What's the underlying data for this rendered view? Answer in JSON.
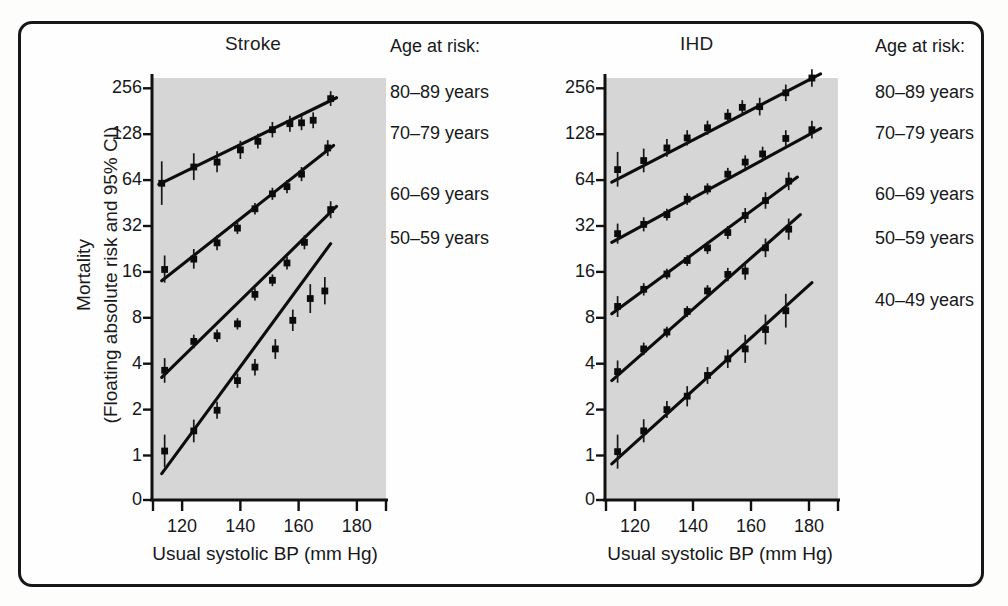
{
  "figure": {
    "background_color": "#fdfdfc",
    "frame_color": "#15181a",
    "plot_background_color": "#d6d6d6",
    "ink_color": "#0d0d0d"
  },
  "axis": {
    "y_title_line1": "Mortality",
    "y_title_line2": "(Floating absolute risk and 95% CI)",
    "y_ticks": [
      "256",
      "128",
      "64",
      "32",
      "16",
      "8",
      "4",
      "2",
      "1",
      "0"
    ],
    "x_title": "Usual systolic BP (mm Hg)",
    "x_ticks": [
      "120",
      "140",
      "160",
      "180"
    ]
  },
  "legend": {
    "heading": "Age at risk:",
    "stroke_items": [
      "80–89 years",
      "70–79 years",
      "60–69 years",
      "50–59 years"
    ],
    "ihd_items": [
      "80–89 years",
      "70–79 years",
      "60–69 years",
      "50–59 years",
      "40–49 years"
    ]
  },
  "panels": [
    {
      "id": "stroke",
      "title": "Stroke"
    },
    {
      "id": "ihd",
      "title": "IHD"
    }
  ],
  "chart_data": {
    "type": "scatter",
    "xlabel": "Usual systolic BP (mm Hg)",
    "ylabel": "Mortality (Floating absolute risk and 95% CI)",
    "xlim": [
      110,
      190
    ],
    "xticks": [
      120,
      140,
      160,
      180
    ],
    "yscale": "log2",
    "yticks": [
      1,
      2,
      4,
      8,
      16,
      32,
      64,
      128,
      256
    ],
    "ytick_labels": [
      "1",
      "2",
      "4",
      "8",
      "16",
      "32",
      "64",
      "128",
      "256"
    ],
    "y_axis_break_label": "0",
    "grid": false,
    "legend_position": "right-outside",
    "legend_title": "Age at risk:",
    "panels": [
      {
        "name": "Stroke",
        "series": [
          {
            "name": "80–89 years",
            "points": [
              {
                "x": 113,
                "y": 61,
                "ci_low": 44,
                "ci_high": 85
              },
              {
                "x": 124,
                "y": 78,
                "ci_low": 64,
                "ci_high": 96
              },
              {
                "x": 132,
                "y": 84,
                "ci_low": 72,
                "ci_high": 99
              },
              {
                "x": 140,
                "y": 101,
                "ci_low": 88,
                "ci_high": 116
              },
              {
                "x": 146,
                "y": 115,
                "ci_low": 103,
                "ci_high": 129
              },
              {
                "x": 151,
                "y": 137,
                "ci_low": 122,
                "ci_high": 154
              },
              {
                "x": 157,
                "y": 150,
                "ci_low": 133,
                "ci_high": 169
              },
              {
                "x": 161,
                "y": 152,
                "ci_low": 136,
                "ci_high": 170
              },
              {
                "x": 165,
                "y": 158,
                "ci_low": 140,
                "ci_high": 178
              },
              {
                "x": 171,
                "y": 219,
                "ci_low": 196,
                "ci_high": 245
              }
            ],
            "fit": {
              "x1": 112,
              "y1": 60,
              "x2": 173,
              "y2": 222
            }
          },
          {
            "name": "70–79 years",
            "points": [
              {
                "x": 114,
                "y": 16.6,
                "ci_low": 13.6,
                "ci_high": 20.5
              },
              {
                "x": 124,
                "y": 19.4,
                "ci_low": 16.8,
                "ci_high": 22.6
              },
              {
                "x": 132,
                "y": 24.8,
                "ci_low": 22.2,
                "ci_high": 27.8
              },
              {
                "x": 139,
                "y": 31.0,
                "ci_low": 28.4,
                "ci_high": 33.8
              },
              {
                "x": 145,
                "y": 41.5,
                "ci_low": 38.0,
                "ci_high": 45.3
              },
              {
                "x": 151,
                "y": 52.0,
                "ci_low": 47.5,
                "ci_high": 57.0
              },
              {
                "x": 156,
                "y": 58.0,
                "ci_low": 52.5,
                "ci_high": 64.0
              },
              {
                "x": 161,
                "y": 70.0,
                "ci_low": 63.0,
                "ci_high": 78.0
              },
              {
                "x": 170,
                "y": 104.0,
                "ci_low": 92.0,
                "ci_high": 117.0
              }
            ],
            "fit": {
              "x1": 113,
              "y1": 14.0,
              "x2": 172,
              "y2": 108.0
            }
          },
          {
            "name": "60–69 years",
            "points": [
              {
                "x": 114,
                "y": 3.62,
                "ci_low": 3.0,
                "ci_high": 4.35
              },
              {
                "x": 124,
                "y": 5.6,
                "ci_low": 5.05,
                "ci_high": 6.2
              },
              {
                "x": 132,
                "y": 6.1,
                "ci_low": 5.55,
                "ci_high": 6.7
              },
              {
                "x": 139,
                "y": 7.3,
                "ci_low": 6.7,
                "ci_high": 7.95
              },
              {
                "x": 145,
                "y": 11.4,
                "ci_low": 10.4,
                "ci_high": 12.5
              },
              {
                "x": 151,
                "y": 14.1,
                "ci_low": 12.9,
                "ci_high": 15.4
              },
              {
                "x": 156,
                "y": 18.3,
                "ci_low": 16.6,
                "ci_high": 20.2
              },
              {
                "x": 162,
                "y": 25.0,
                "ci_low": 22.5,
                "ci_high": 27.8
              },
              {
                "x": 171,
                "y": 41.0,
                "ci_low": 36.0,
                "ci_high": 46.5
              }
            ],
            "fit": {
              "x1": 113,
              "y1": 3.25,
              "x2": 173,
              "y2": 43.0
            }
          },
          {
            "name": "50–59 years",
            "points": [
              {
                "x": 114,
                "y": 1.07,
                "ci_low": 0.84,
                "ci_high": 1.37
              },
              {
                "x": 124,
                "y": 1.45,
                "ci_low": 1.22,
                "ci_high": 1.72
              },
              {
                "x": 132,
                "y": 1.98,
                "ci_low": 1.74,
                "ci_high": 2.25
              },
              {
                "x": 139,
                "y": 3.1,
                "ci_low": 2.78,
                "ci_high": 3.45
              },
              {
                "x": 145,
                "y": 3.8,
                "ci_low": 3.35,
                "ci_high": 4.3
              },
              {
                "x": 152,
                "y": 5.0,
                "ci_low": 4.3,
                "ci_high": 5.8
              },
              {
                "x": 158,
                "y": 7.7,
                "ci_low": 6.55,
                "ci_high": 9.05
              },
              {
                "x": 164,
                "y": 10.7,
                "ci_low": 8.6,
                "ci_high": 13.3
              },
              {
                "x": 169,
                "y": 12.0,
                "ci_low": 9.8,
                "ci_high": 14.8
              }
            ],
            "fit": {
              "x1": 113,
              "y1": 0.76,
              "x2": 171,
              "y2": 24.5
            }
          }
        ]
      },
      {
        "name": "IHD",
        "series": [
          {
            "name": "80–89 years",
            "points": [
              {
                "x": 114,
                "y": 75,
                "ci_low": 58,
                "ci_high": 98
              },
              {
                "x": 123,
                "y": 86,
                "ci_low": 72,
                "ci_high": 103
              },
              {
                "x": 131,
                "y": 104,
                "ci_low": 91,
                "ci_high": 119
              },
              {
                "x": 138,
                "y": 121,
                "ci_low": 108,
                "ci_high": 136
              },
              {
                "x": 145,
                "y": 141,
                "ci_low": 127,
                "ci_high": 157
              },
              {
                "x": 152,
                "y": 168,
                "ci_low": 151,
                "ci_high": 187
              },
              {
                "x": 157,
                "y": 192,
                "ci_low": 172,
                "ci_high": 214
              },
              {
                "x": 163,
                "y": 194,
                "ci_low": 170,
                "ci_high": 222
              },
              {
                "x": 172,
                "y": 239,
                "ci_low": 211,
                "ci_high": 271
              },
              {
                "x": 181,
                "y": 299,
                "ci_low": 262,
                "ci_high": 341
              }
            ],
            "fit": {
              "x1": 112,
              "y1": 62,
              "x2": 184,
              "y2": 318
            }
          },
          {
            "name": "70–79 years",
            "points": [
              {
                "x": 114,
                "y": 28.5,
                "ci_low": 24.5,
                "ci_high": 33.2
              },
              {
                "x": 123,
                "y": 32.8,
                "ci_low": 29.5,
                "ci_high": 36.5
              },
              {
                "x": 131,
                "y": 38.0,
                "ci_low": 34.8,
                "ci_high": 41.5
              },
              {
                "x": 138,
                "y": 48.0,
                "ci_low": 44.0,
                "ci_high": 52.5
              },
              {
                "x": 145,
                "y": 56.0,
                "ci_low": 51.5,
                "ci_high": 61.0
              },
              {
                "x": 152,
                "y": 70.0,
                "ci_low": 64.0,
                "ci_high": 77.0
              },
              {
                "x": 158,
                "y": 84.0,
                "ci_low": 76.0,
                "ci_high": 93.0
              },
              {
                "x": 164,
                "y": 95.0,
                "ci_low": 85.0,
                "ci_high": 106.0
              },
              {
                "x": 172,
                "y": 120.0,
                "ci_low": 106.0,
                "ci_high": 136.0
              },
              {
                "x": 181,
                "y": 137.0,
                "ci_low": 120.0,
                "ci_high": 157.0
              }
            ],
            "fit": {
              "x1": 112,
              "y1": 25.0,
              "x2": 184,
              "y2": 140.0
            }
          },
          {
            "name": "60–69 years",
            "points": [
              {
                "x": 114,
                "y": 9.5,
                "ci_low": 8.1,
                "ci_high": 11.1
              },
              {
                "x": 123,
                "y": 12.3,
                "ci_low": 11.2,
                "ci_high": 13.5
              },
              {
                "x": 131,
                "y": 15.5,
                "ci_low": 14.3,
                "ci_high": 16.8
              },
              {
                "x": 138,
                "y": 19.0,
                "ci_low": 17.5,
                "ci_high": 20.6
              },
              {
                "x": 145,
                "y": 23.0,
                "ci_low": 21.0,
                "ci_high": 25.2
              },
              {
                "x": 152,
                "y": 29.0,
                "ci_low": 26.3,
                "ci_high": 32.0
              },
              {
                "x": 158,
                "y": 37.5,
                "ci_low": 33.5,
                "ci_high": 42.0
              },
              {
                "x": 165,
                "y": 47.0,
                "ci_low": 41.5,
                "ci_high": 53.3
              },
              {
                "x": 173,
                "y": 63.0,
                "ci_low": 55.0,
                "ci_high": 72.0
              }
            ],
            "fit": {
              "x1": 112,
              "y1": 8.5,
              "x2": 176,
              "y2": 67.0
            }
          },
          {
            "name": "50–59 years",
            "points": [
              {
                "x": 114,
                "y": 3.55,
                "ci_low": 3.0,
                "ci_high": 4.2
              },
              {
                "x": 123,
                "y": 5.0,
                "ci_low": 4.55,
                "ci_high": 5.5
              },
              {
                "x": 131,
                "y": 6.45,
                "ci_low": 5.95,
                "ci_high": 7.0
              },
              {
                "x": 138,
                "y": 8.8,
                "ci_low": 8.1,
                "ci_high": 9.55
              },
              {
                "x": 145,
                "y": 12.0,
                "ci_low": 11.0,
                "ci_high": 13.1
              },
              {
                "x": 152,
                "y": 15.4,
                "ci_low": 13.9,
                "ci_high": 17.0
              },
              {
                "x": 158,
                "y": 16.2,
                "ci_low": 14.2,
                "ci_high": 18.5
              },
              {
                "x": 165,
                "y": 23.0,
                "ci_low": 20.0,
                "ci_high": 26.5
              },
              {
                "x": 173,
                "y": 30.5,
                "ci_low": 26.0,
                "ci_high": 35.8
              }
            ],
            "fit": {
              "x1": 112,
              "y1": 3.1,
              "x2": 177,
              "y2": 38.0
            }
          },
          {
            "name": "40–49 years",
            "points": [
              {
                "x": 114,
                "y": 1.06,
                "ci_low": 0.82,
                "ci_high": 1.37
              },
              {
                "x": 123,
                "y": 1.45,
                "ci_low": 1.22,
                "ci_high": 1.73
              },
              {
                "x": 131,
                "y": 2.0,
                "ci_low": 1.76,
                "ci_high": 2.28
              },
              {
                "x": 138,
                "y": 2.45,
                "ci_low": 2.1,
                "ci_high": 2.85
              },
              {
                "x": 145,
                "y": 3.35,
                "ci_low": 2.95,
                "ci_high": 3.8
              },
              {
                "x": 152,
                "y": 4.3,
                "ci_low": 3.75,
                "ci_high": 4.95
              },
              {
                "x": 158,
                "y": 5.0,
                "ci_low": 4.05,
                "ci_high": 6.2
              },
              {
                "x": 165,
                "y": 6.7,
                "ci_low": 5.35,
                "ci_high": 8.4
              },
              {
                "x": 172,
                "y": 8.9,
                "ci_low": 6.9,
                "ci_high": 11.5
              }
            ],
            "fit": {
              "x1": 112,
              "y1": 0.88,
              "x2": 181,
              "y2": 13.6
            }
          }
        ]
      }
    ]
  }
}
